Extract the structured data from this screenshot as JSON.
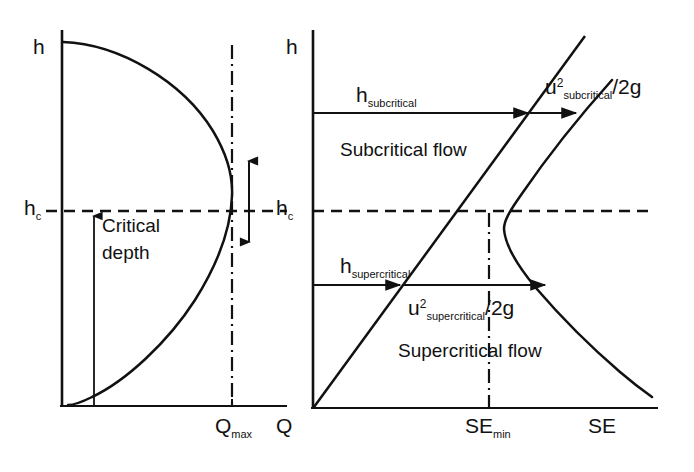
{
  "figure": {
    "stroke_color": "#111111",
    "background": "#ffffff"
  },
  "left_panel": {
    "name": "depth-discharge-diagram",
    "y_axis_label": "h",
    "critical_depth_label": "h",
    "critical_depth_subscript": "c",
    "x_axis_tick_label": "Q",
    "x_axis_tick_subscript": "max",
    "x_axis_label": "Q",
    "annotation_line1": "Critical",
    "annotation_line2": "depth"
  },
  "right_panel": {
    "name": "specific-energy-diagram",
    "y_axis_label": "h",
    "critical_depth_label": "h",
    "critical_depth_subscript": "c",
    "x_axis_tick_label": "SE",
    "x_axis_tick_subscript": "min",
    "x_axis_label": "SE",
    "subcritical_depth_symbol": "h",
    "subcritical_depth_subscript": "subcritical",
    "subcritical_head_symbol": "u",
    "subcritical_head_superscript": "2",
    "subcritical_head_subscript": "subcritical",
    "subcritical_head_divisor": "/2g",
    "subcritical_region_label": "Subcritical flow",
    "supercritical_depth_symbol": "h",
    "supercritical_depth_subscript": "supercritical",
    "supercritical_head_symbol": "u",
    "supercritical_head_superscript": "2",
    "supercritical_head_subscript": "supercritical",
    "supercritical_head_divisor": "/2g",
    "supercritical_region_label": "Supercritical flow"
  }
}
